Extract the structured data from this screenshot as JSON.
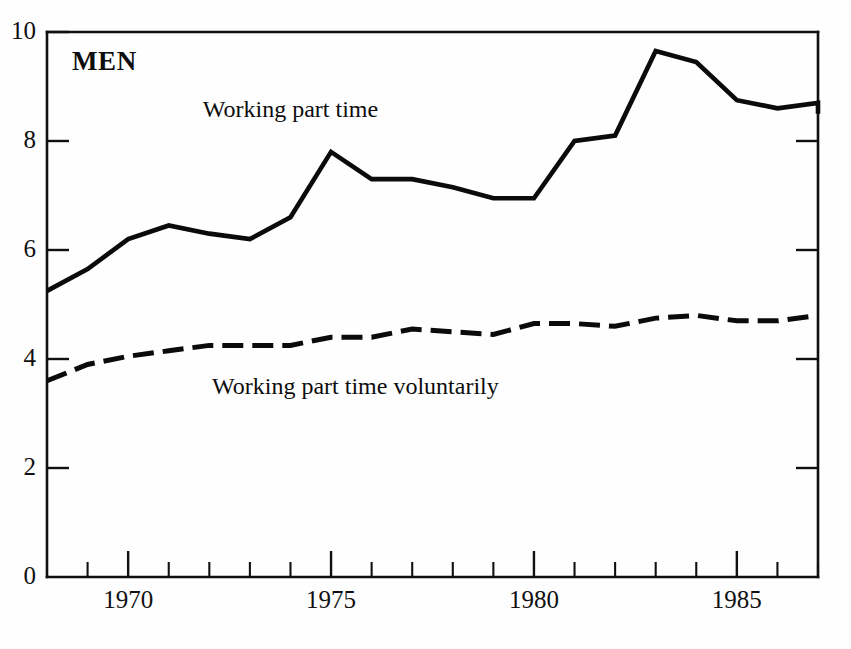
{
  "chart_data": {
    "type": "line",
    "title": "MEN",
    "xlabel": "",
    "ylabel": "",
    "xlim": [
      1968,
      1987
    ],
    "ylim": [
      0,
      10
    ],
    "grid": false,
    "legend_position": "inline-annotation",
    "y_ticks": [
      "0",
      "2",
      "4",
      "6",
      "8",
      "10"
    ],
    "y_tick_values": [
      0,
      2,
      4,
      6,
      8,
      10
    ],
    "x_ticks": [
      "1970",
      "1975",
      "1980",
      "1985"
    ],
    "x_tick_values": [
      1970,
      1975,
      1980,
      1985
    ],
    "x_minor_tick_values": [
      1969,
      1971,
      1972,
      1973,
      1974,
      1976,
      1977,
      1978,
      1979,
      1981,
      1982,
      1983,
      1984,
      1986,
      1987
    ],
    "x": [
      1968,
      1969,
      1970,
      1971,
      1972,
      1973,
      1974,
      1975,
      1976,
      1977,
      1978,
      1979,
      1980,
      1981,
      1982,
      1983,
      1984,
      1985,
      1986,
      1987
    ],
    "series": [
      {
        "name": "Working part time",
        "style": "solid",
        "label_x": 1974.0,
        "label_y": 8.45,
        "values": [
          5.25,
          5.65,
          6.2,
          6.45,
          6.3,
          6.2,
          6.6,
          7.8,
          7.3,
          7.3,
          7.15,
          6.95,
          6.95,
          8.0,
          8.1,
          9.65,
          9.45,
          8.75,
          8.6,
          8.7
        ]
      },
      {
        "name": "Working part time voluntarily",
        "style": "dashed",
        "label_x": 1975.6,
        "label_y": 3.35,
        "values": [
          3.6,
          3.9,
          4.05,
          4.15,
          4.25,
          4.25,
          4.25,
          4.4,
          4.4,
          4.55,
          4.5,
          4.45,
          4.65,
          4.65,
          4.6,
          4.75,
          4.8,
          4.7,
          4.7,
          4.8
        ]
      }
    ],
    "series_tail": {
      "Working part time": [
        8.5
      ],
      "Working part time voluntarily": [
        4.8
      ]
    },
    "colors": {
      "line": "#0b0b0b",
      "axis": "#101010",
      "background": "#fefefe"
    }
  },
  "annotations": {
    "series_solid_label": "Working part time",
    "series_dashed_label": "Working part time voluntarily",
    "plot_title": "MEN"
  }
}
